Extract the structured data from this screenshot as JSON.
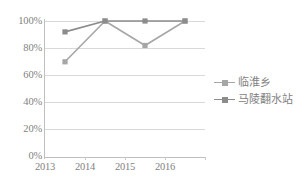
{
  "chart_data": {
    "type": "line",
    "title": "",
    "xlabel": "",
    "ylabel": "",
    "categories": [
      "2013",
      "2014",
      "2015",
      "2016"
    ],
    "x": [
      2013,
      2014,
      2015,
      2016
    ],
    "ylim": [
      0,
      100
    ],
    "ytick_labels": [
      "100%",
      "80%",
      "60%",
      "40%",
      "20%",
      "0%"
    ],
    "ytick_values": [
      100,
      80,
      60,
      40,
      20,
      0
    ],
    "grid": true,
    "legend_position": "right",
    "series": [
      {
        "name": "临淮乡",
        "color": "#a6a6a6",
        "values": [
          70,
          100,
          82,
          100
        ]
      },
      {
        "name": "马陵翻水站",
        "color": "#8c8c8c",
        "values": [
          92,
          100,
          100,
          100
        ]
      }
    ]
  },
  "legend": {
    "entries": [
      {
        "label": "临淮乡"
      },
      {
        "label": "马陵翻水站"
      }
    ]
  },
  "axes": {
    "y_labels": [
      "100%",
      "80%",
      "60%",
      "40%",
      "20%",
      "0%"
    ],
    "x_labels": [
      "2013",
      "2014",
      "2015",
      "2016"
    ]
  },
  "colors": {
    "series_1": "#a6a6a6",
    "series_2": "#8c8c8c",
    "gridline": "#d9d9d9",
    "axis": "#bfbfbf",
    "text": "#7f7f7f",
    "background": "#ffffff"
  }
}
